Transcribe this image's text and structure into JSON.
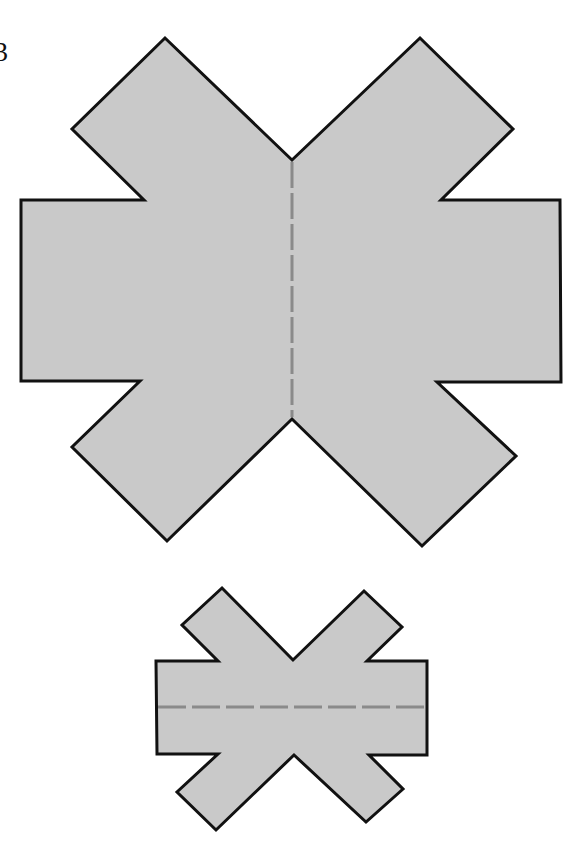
{
  "figure": {
    "label": "3",
    "colors": {
      "fill": "#c9c9c9",
      "outline": "#111111",
      "fold_line": "#8a8a8a",
      "background": "#ffffff"
    },
    "shapes": [
      {
        "name": "large-net",
        "description": "X-shaped paper net with vertical dashed fold line",
        "points": "292,160 165,38 72,129 144,200 21,200 21,381 140,381 72,447 167,541 292,419 422,546 516,456 437,382 561,382 560,200 441,200 513,129 420,38",
        "fold_line": {
          "x1": 292,
          "y1": 162,
          "x2": 292,
          "y2": 417
        }
      },
      {
        "name": "small-net",
        "description": "Smaller X-shaped paper net with horizontal dashed fold line",
        "points": "293,660 222,588 182,625 218,661 156,661 157,754 218,754 177,792 216,830 294,755 366,822 403,789 369,755 427,755 427,661 367,661 402,627 364,591",
        "fold_line": {
          "x1": 158,
          "y1": 707,
          "x2": 425,
          "y2": 707
        }
      }
    ]
  }
}
